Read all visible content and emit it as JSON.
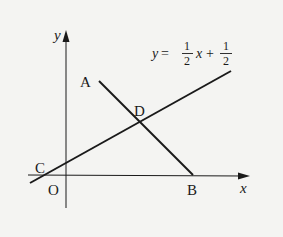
{
  "diagram": {
    "type": "coordinate-geometry",
    "axes": {
      "x_label": "x",
      "y_label": "y",
      "origin_label": "O"
    },
    "points": {
      "A": "A",
      "B": "B",
      "C": "C",
      "D": "D",
      "O": "O"
    },
    "line_equation": {
      "lhs": "y",
      "equals": "=",
      "coef_num": "1",
      "coef_den": "2",
      "var": "x",
      "plus": "+",
      "const_num": "1",
      "const_den": "2",
      "full_text": "y = 1/2 x + 1/2"
    },
    "segments": [
      "AB"
    ],
    "lines": [
      "CD (y = 1/2 x + 1/2)"
    ],
    "colors": {
      "ink": "#1a1a1a",
      "background": "#f4f4f2"
    }
  }
}
